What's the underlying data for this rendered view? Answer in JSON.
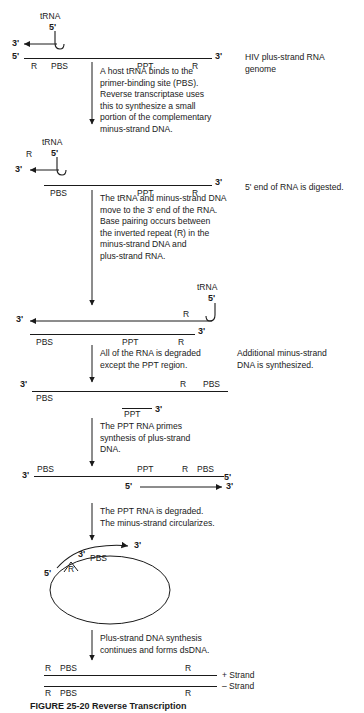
{
  "figure": {
    "caption": "FIGURE 25-20  Reverse Transcription"
  },
  "steps": [
    {
      "id": "step1",
      "arrow_text": "A host tRNA binds to the\nprimer-binding site (PBS).\nReverse transcriptase uses\nthis to synthesize a small\nportion of the complementary\nminus-strand DNA.",
      "side_text": "HIV plus-strand RNA\ngenome"
    },
    {
      "id": "step2",
      "arrow_text": "The tRNA and minus-strand DNA\nmove to the 3' end of the RNA.\nBase pairing occurs between\nthe inverted repeat (R) in the\nminus-strand DNA and\nplus-strand RNA.",
      "side_text": "5' end of RNA is digested."
    },
    {
      "id": "step3",
      "arrow_text": "All of the RNA is degraded\nexcept the PPT region.",
      "side_text": "Additional minus-strand\nDNA is synthesized."
    },
    {
      "id": "step4",
      "arrow_text": "The PPT RNA primes\nsynthesis of plus-strand\nDNA.",
      "side_text": ""
    },
    {
      "id": "step5",
      "arrow_text": "The PPT RNA is degraded.\nThe minus-strand circularizes.",
      "side_text": ""
    },
    {
      "id": "step6",
      "arrow_text": "Plus-strand DNA synthesis\ncontinues and forms dsDNA.",
      "side_text": ""
    }
  ],
  "panels": {
    "panel1": {
      "trna_label": "tRNA",
      "trna_prime": "5'",
      "left_prime_top": "3'",
      "left_prime_bottom": "5'",
      "right_prime": "3'",
      "regions": [
        "R",
        "PBS",
        "PPT",
        "R"
      ]
    },
    "panel2": {
      "trna_label": "tRNA",
      "trna_prime": "5'",
      "r_label": "R",
      "left_prime": "3'",
      "right_prime": "3'",
      "regions": [
        "PBS",
        "PPT",
        "R"
      ]
    },
    "panel3": {
      "trna_label": "tRNA",
      "trna_prime": "5'",
      "r_top": "R",
      "left_prime": "3'",
      "right_prime": "3'",
      "regions": [
        "PBS",
        "PPT",
        "R"
      ]
    },
    "panel4": {
      "left_prime": "3'",
      "top_right_labels": [
        "R",
        "PBS"
      ],
      "bottom_label": "PPT",
      "bottom_prime": "3'",
      "pbs_label": "PBS"
    },
    "panel5": {
      "left_prime": "3'",
      "top_labels": [
        "PBS",
        "PPT",
        "R",
        "PBS"
      ],
      "top_right_prime": "5'",
      "bottom_left_prime": "5'",
      "bottom_right_prime": "3'"
    },
    "panel6": {
      "prime_5": "5'",
      "prime_3_tip": "3'",
      "prime_3_inner": "3'",
      "r_label": "R",
      "pbs_label": "PBS"
    },
    "panel7": {
      "top_labels": [
        "R",
        "PBS",
        "R"
      ],
      "bottom_labels": [
        "R",
        "PBS",
        "R"
      ],
      "plus_strand": "+ Strand",
      "minus_strand": "– Strand"
    }
  },
  "colors": {
    "ink": "#1a1a1a",
    "background": "#ffffff"
  }
}
